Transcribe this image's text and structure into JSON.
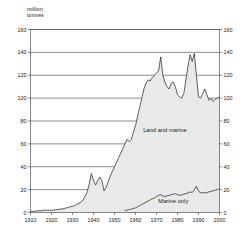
{
  "chart_data": {
    "type": "area",
    "title": "",
    "subtitle": "",
    "ylabel": "million\ntonnes",
    "ylabel_line1": "million",
    "ylabel_line2": "tonnes",
    "xlabel": "",
    "ylim": [
      0,
      160
    ],
    "xlim": [
      1910,
      2000
    ],
    "yticks": [
      0,
      20,
      40,
      60,
      80,
      100,
      120,
      140,
      160
    ],
    "ytick_labels": [
      "0",
      "20",
      "40",
      "60",
      "80",
      "100",
      "120",
      "140",
      "160"
    ],
    "xticks": [
      1910,
      1920,
      1930,
      1940,
      1950,
      1960,
      1970,
      1980,
      1990,
      2000
    ],
    "xtick_labels": [
      "1910",
      "1920",
      "1930",
      "1940",
      "1950",
      "1960",
      "1970",
      "1980",
      "1990",
      "2000"
    ],
    "grid": "horizontal",
    "right_axis_mirrored": true,
    "legend_position": "inline-annotation",
    "fill_color": "#e9e9e9",
    "line_color": "#2b2b2b",
    "axis_color": "#555555",
    "grid_color": "#444444",
    "background": "#ffffff",
    "annotations": [
      {
        "text": "Land and marine",
        "x": 1974,
        "y": 70
      },
      {
        "text": "Marine only",
        "x": 1978,
        "y": 8
      }
    ],
    "series": [
      {
        "name": "Land and marine",
        "label": "Land and marine",
        "x": [
          1910,
          1911,
          1912,
          1913,
          1914,
          1915,
          1916,
          1917,
          1918,
          1919,
          1920,
          1921,
          1922,
          1923,
          1924,
          1925,
          1926,
          1927,
          1928,
          1929,
          1930,
          1931,
          1932,
          1933,
          1934,
          1935,
          1936,
          1937,
          1938,
          1939,
          1940,
          1941,
          1942,
          1943,
          1944,
          1945,
          1946,
          1947,
          1948,
          1949,
          1950,
          1951,
          1952,
          1953,
          1954,
          1955,
          1956,
          1957,
          1958,
          1959,
          1960,
          1961,
          1962,
          1963,
          1964,
          1965,
          1966,
          1967,
          1968,
          1969,
          1970,
          1971,
          1972,
          1973,
          1974,
          1975,
          1976,
          1977,
          1978,
          1979,
          1980,
          1981,
          1982,
          1983,
          1984,
          1985,
          1986,
          1987,
          1988,
          1989,
          1990,
          1991,
          1992,
          1993,
          1994,
          1995,
          1996,
          1997,
          1998,
          1999,
          2000
        ],
        "y": [
          1,
          1,
          1,
          1.5,
          1.5,
          1.5,
          2,
          2,
          2,
          2,
          2,
          2,
          2.5,
          2.5,
          3,
          3,
          3.5,
          4,
          4.5,
          5,
          5.5,
          6,
          7,
          8,
          9,
          11,
          14,
          18,
          25,
          34,
          28,
          24,
          28,
          31,
          28,
          19,
          22,
          27,
          32,
          36,
          40,
          44,
          48,
          52,
          56,
          60,
          64,
          62,
          64,
          70,
          76,
          84,
          92,
          100,
          108,
          113,
          116,
          115,
          118,
          120,
          122,
          124,
          136,
          120,
          114,
          110,
          108,
          113,
          114,
          110,
          103,
          101,
          100,
          104,
          116,
          128,
          138,
          132,
          139,
          120,
          101,
          100,
          104,
          108,
          103,
          98,
          100,
          97,
          99,
          100,
          101
        ]
      },
      {
        "name": "Marine only",
        "label": "Marine only",
        "x": [
          1955,
          1956,
          1957,
          1958,
          1959,
          1960,
          1961,
          1962,
          1963,
          1964,
          1965,
          1966,
          1967,
          1968,
          1969,
          1970,
          1971,
          1972,
          1973,
          1974,
          1975,
          1976,
          1977,
          1978,
          1979,
          1980,
          1981,
          1982,
          1983,
          1984,
          1985,
          1986,
          1987,
          1988,
          1989,
          1990,
          1991,
          1992,
          1993,
          1994,
          1995,
          1996,
          1997,
          1998,
          1999,
          2000
        ],
        "y": [
          2,
          2,
          2.5,
          3,
          3.5,
          4,
          5,
          6,
          7,
          8,
          9,
          10,
          11,
          12,
          12.5,
          14,
          15,
          15.5,
          14.5,
          14,
          14.5,
          15,
          15.5,
          16,
          16.5,
          15.5,
          15,
          15.5,
          16,
          16.5,
          17,
          18,
          17.5,
          20,
          23,
          19,
          17,
          17.5,
          17,
          17.5,
          18,
          18.5,
          19,
          19.5,
          20,
          21
        ]
      }
    ]
  }
}
